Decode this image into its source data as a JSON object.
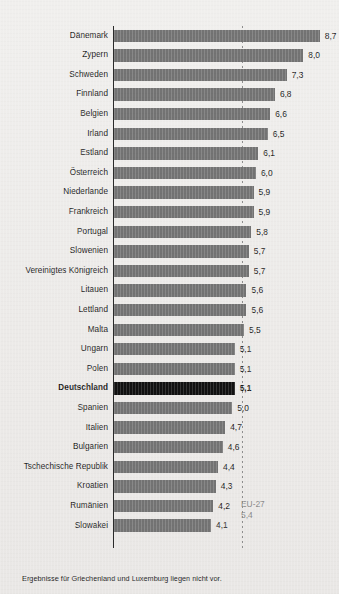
{
  "chart_data": {
    "type": "bar",
    "orientation": "horizontal",
    "title": "",
    "xlabel": "",
    "ylabel": "",
    "xlim": [
      0,
      9.2
    ],
    "grid": false,
    "legend": "none",
    "value_format": "de-DE one decimal, comma separator",
    "categories": [
      "Dänemark",
      "Zypern",
      "Schweden",
      "Finnland",
      "Belgien",
      "Irland",
      "Estland",
      "Österreich",
      "Niederlande",
      "Frankreich",
      "Portugal",
      "Slowenien",
      "Vereinigtes Königreich",
      "Litauen",
      "Lettland",
      "Malta",
      "Ungarn",
      "Polen",
      "Deutschland",
      "Spanien",
      "Italien",
      "Bulgarien",
      "Tschechische Republik",
      "Kroatien",
      "Rumänien",
      "Slowakei"
    ],
    "values": [
      8.7,
      8.0,
      7.3,
      6.8,
      6.6,
      6.5,
      6.1,
      6.0,
      5.9,
      5.9,
      5.8,
      5.7,
      5.7,
      5.6,
      5.6,
      5.5,
      5.1,
      5.1,
      5.1,
      5.0,
      4.7,
      4.6,
      4.4,
      4.3,
      4.2,
      4.1
    ],
    "value_labels": [
      "8,7",
      "8,0",
      "7,3",
      "6,8",
      "6,6",
      "6,5",
      "6,1",
      "6,0",
      "5,9",
      "5,9",
      "5,8",
      "5,7",
      "5,7",
      "5,6",
      "5,6",
      "5,5",
      "5,1",
      "5,1",
      "5,1",
      "5,0",
      "4,7",
      "4,6",
      "4,4",
      "4,3",
      "4,2",
      "4,1"
    ],
    "highlight_category": "Deutschland",
    "reference_line": {
      "label": "EU-27",
      "value": 5.4,
      "value_label": "5,4",
      "style": "dotted"
    },
    "colors": {
      "bar": "#737373",
      "bar_highlight": "#111111",
      "axis": "#2a2a2a",
      "reference_line": "#8e8e8e",
      "reference_text": "#8b8b8b",
      "text": "#1d1d1d",
      "background": "#edebe9"
    }
  },
  "footnote": "Ergebnisse für Griechenland und Luxemburg liegen nicht vor."
}
